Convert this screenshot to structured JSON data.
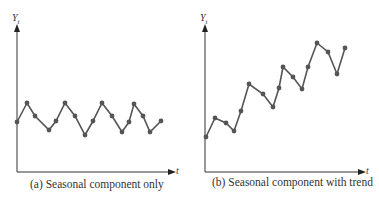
{
  "chart_data": [
    {
      "type": "line",
      "title": "(a) Seasonal component only",
      "xlabel": "t",
      "ylabel": "Y_t",
      "grid": false,
      "markers": true,
      "x": [
        1,
        2,
        3,
        4,
        5,
        6,
        7,
        8,
        9,
        10,
        11,
        12,
        13,
        14,
        15,
        16,
        17
      ],
      "values": [
        50,
        69,
        56,
        42,
        51,
        69,
        56,
        37,
        51,
        69,
        56,
        40,
        50,
        68,
        56,
        40,
        51
      ],
      "pixel_points": [
        [
          17,
          122
        ],
        [
          27,
          103
        ],
        [
          35,
          116
        ],
        [
          49,
          130
        ],
        [
          56,
          121
        ],
        [
          65,
          103
        ],
        [
          75,
          116
        ],
        [
          85,
          135
        ],
        [
          93,
          121
        ],
        [
          102,
          103
        ],
        [
          112,
          116
        ],
        [
          122,
          132
        ],
        [
          129,
          122
        ],
        [
          134,
          104
        ],
        [
          143,
          116
        ],
        [
          150,
          132
        ],
        [
          161,
          121
        ]
      ],
      "ylim": [
        0,
        148
      ]
    },
    {
      "type": "line",
      "title": "(b) Seasonal component with trend",
      "xlabel": "t",
      "ylabel": "Y_t",
      "grid": false,
      "markers": true,
      "x": [
        1,
        2,
        3,
        4,
        5,
        6,
        7,
        8,
        9,
        10,
        11,
        12,
        13,
        14,
        15,
        16,
        17
      ],
      "values": [
        35,
        54,
        49,
        41,
        61,
        88,
        78,
        65,
        84,
        105,
        95,
        83,
        105,
        129,
        120,
        98,
        124
      ],
      "pixel_points": [
        [
          206,
          137
        ],
        [
          215,
          118
        ],
        [
          226,
          123
        ],
        [
          234,
          131
        ],
        [
          241,
          111
        ],
        [
          249,
          84
        ],
        [
          263,
          94
        ],
        [
          273,
          107
        ],
        [
          279,
          88
        ],
        [
          283,
          67
        ],
        [
          293,
          77
        ],
        [
          302,
          89
        ],
        [
          308,
          67
        ],
        [
          317,
          43
        ],
        [
          328,
          52
        ],
        [
          337,
          74
        ],
        [
          345,
          48
        ]
      ],
      "ylim": [
        0,
        148
      ]
    }
  ],
  "labels": {
    "a": {
      "ylabel_main": "Y",
      "ylabel_sub": "t",
      "xlabel": "t",
      "caption": "(a) Seasonal component only"
    },
    "b": {
      "ylabel_main": "Y",
      "ylabel_sub": "t",
      "xlabel": "t",
      "caption": "(b) Seasonal component with trend"
    }
  },
  "colors": {
    "axis": "#333333",
    "line": "#555555",
    "marker": "#555555"
  }
}
